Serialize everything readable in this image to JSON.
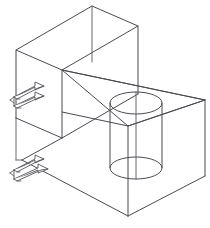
{
  "figure": {
    "caption": "",
    "background_color": "#ffffff",
    "line_color": "#4a4a52",
    "line_width_px": 1,
    "canvas": {
      "width": 210,
      "height": 228
    },
    "projection": "isometric-wireframe",
    "style": "line-drawing"
  },
  "geometry": {
    "upper_box": {
      "name": "upper-enclosure",
      "description": "Open rectangular box, upper-left, drawn in isometric wireframe",
      "vertices": {
        "top_apex": [
          92,
          6
        ],
        "top_left": [
          16,
          50
        ],
        "top_right": [
          138,
          26
        ],
        "top_far": [
          62,
          70
        ],
        "left_lower": [
          16,
          118
        ],
        "right_lower": [
          138,
          94
        ],
        "mid_lower": [
          62,
          138
        ]
      }
    },
    "lower_box": {
      "name": "lower-enclosure",
      "description": "Rectangular box, lower-right, sharing the central vertical edge",
      "vertices": {
        "top_left": [
          62,
          70
        ],
        "top_right": [
          205,
          100
        ],
        "far_top": [
          128,
          126
        ],
        "bottom_apex": [
          128,
          216
        ],
        "right_lower": [
          205,
          176
        ],
        "left_lower": [
          22,
          160
        ]
      }
    },
    "cylinder": {
      "name": "inner-cylinder",
      "description": "Vertical cylinder inside the lower enclosure",
      "center_top": [
        136,
        103
      ],
      "center_bottom": [
        136,
        168
      ],
      "radius_x": 26,
      "radius_y": 11,
      "height_px": 65
    },
    "arrow_groups": [
      {
        "name": "upper-inlet-arrows",
        "count": 2,
        "direction": "right-into-enclosure",
        "anchor": [
          10,
          86
        ]
      },
      {
        "name": "lower-inlet-arrows",
        "count": 2,
        "direction": "right-into-enclosure",
        "anchor": [
          10,
          158
        ]
      }
    ]
  },
  "labels": {
    "visible_text": []
  }
}
